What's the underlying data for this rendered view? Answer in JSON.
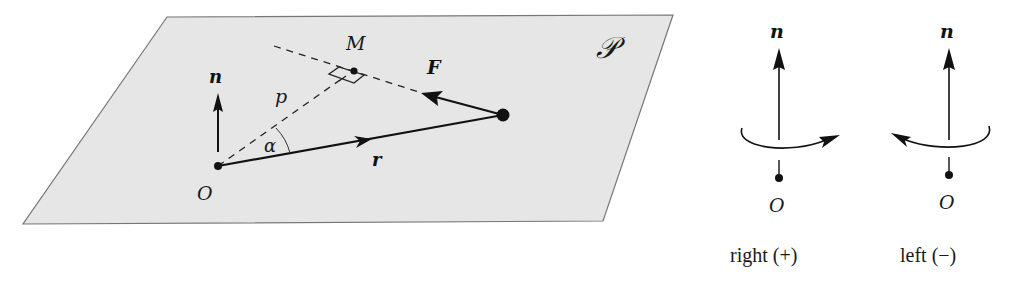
{
  "figure": {
    "plane_label": "𝒫",
    "left": {
      "normal_label": "n",
      "origin_label": "O",
      "foot_label": "M",
      "distance_label": "p",
      "angle_label": "α",
      "force_label": "F",
      "position_label": "r"
    },
    "right": {
      "panels": [
        {
          "normal_label": "n",
          "origin_label": "O",
          "caption": "right (+)",
          "rotation": "clockwise-arrow-right"
        },
        {
          "normal_label": "n",
          "origin_label": "O",
          "caption": "left (−)",
          "rotation": "counterclockwise-arrow-left"
        }
      ]
    },
    "colors": {
      "plane_fill": "#e6e6e6",
      "plane_stroke": "#777777",
      "ink": "#111111"
    }
  }
}
